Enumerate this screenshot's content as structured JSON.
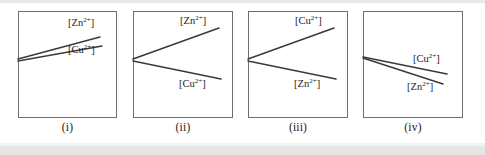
{
  "figure": {
    "kind": "multi-panel-line-graph-options",
    "panel_count": 4,
    "species": {
      "zinc": "[Zn2+]",
      "copper": "[Cu2+]"
    },
    "label_parts": {
      "zinc_open": "[Zn",
      "zinc_charge": "2+",
      "zinc_close": "]",
      "copper_open": "[Cu",
      "copper_charge": "2+",
      "copper_close": "]"
    },
    "colors": {
      "line": "#3a3a3e",
      "box_border": "#6e6e72",
      "background": "#ffffff",
      "text": "#1b1b1b",
      "page_edge": "#e9e9ea"
    }
  },
  "panels": [
    {
      "id": "panel-i",
      "caption": "(i)",
      "box": {
        "x": 18,
        "y": 11,
        "width": 99,
        "height": 107
      },
      "lines": [
        {
          "name": "zinc",
          "label": "[Zn2+]",
          "x1": 0,
          "y1": 48,
          "x2": 82,
          "y2": 26,
          "trend": "rising",
          "slope": "steeper"
        },
        {
          "name": "copper",
          "label": "[Cu2+]",
          "x1": 0,
          "y1": 50,
          "x2": 84,
          "y2": 35,
          "trend": "rising",
          "slope": "shallower"
        }
      ],
      "labels": [
        {
          "name": "zinc",
          "x": 50,
          "y": 7
        },
        {
          "name": "copper",
          "x": 50,
          "y": 34
        }
      ]
    },
    {
      "id": "panel-ii",
      "caption": "(ii)",
      "box": {
        "x": 133,
        "y": 11,
        "width": 100,
        "height": 107
      },
      "lines": [
        {
          "name": "zinc",
          "label": "[Zn2+]",
          "x1": 0,
          "y1": 48,
          "x2": 86,
          "y2": 17,
          "trend": "rising",
          "slope": "positive"
        },
        {
          "name": "copper",
          "label": "[Cu2+]",
          "x1": 0,
          "y1": 50,
          "x2": 88,
          "y2": 68,
          "trend": "falling",
          "slope": "negative"
        }
      ],
      "labels": [
        {
          "name": "zinc",
          "x": 47,
          "y": 5
        },
        {
          "name": "copper",
          "x": 46,
          "y": 68
        }
      ]
    },
    {
      "id": "panel-iii",
      "caption": "(iii)",
      "box": {
        "x": 248,
        "y": 11,
        "width": 100,
        "height": 107
      },
      "lines": [
        {
          "name": "copper",
          "label": "[Cu2+]",
          "x1": 0,
          "y1": 48,
          "x2": 86,
          "y2": 17,
          "trend": "rising",
          "slope": "positive"
        },
        {
          "name": "zinc",
          "label": "[Zn2+]",
          "x1": 0,
          "y1": 50,
          "x2": 88,
          "y2": 68,
          "trend": "falling",
          "slope": "negative"
        }
      ],
      "labels": [
        {
          "name": "copper",
          "x": 47,
          "y": 5
        },
        {
          "name": "zinc",
          "x": 46,
          "y": 68
        }
      ]
    },
    {
      "id": "panel-iv",
      "caption": "(iv)",
      "box": {
        "x": 363,
        "y": 11,
        "width": 100,
        "height": 107
      },
      "lines": [
        {
          "name": "copper",
          "label": "[Cu2+]",
          "x1": 0,
          "y1": 46,
          "x2": 84,
          "y2": 63,
          "trend": "falling",
          "slope": "shallower"
        },
        {
          "name": "zinc",
          "label": "[Zn2+]",
          "x1": 0,
          "y1": 47,
          "x2": 80,
          "y2": 73,
          "trend": "falling",
          "slope": "steeper"
        }
      ],
      "labels": [
        {
          "name": "copper",
          "x": 50,
          "y": 43
        },
        {
          "name": "zinc",
          "x": 44,
          "y": 71
        }
      ]
    }
  ]
}
